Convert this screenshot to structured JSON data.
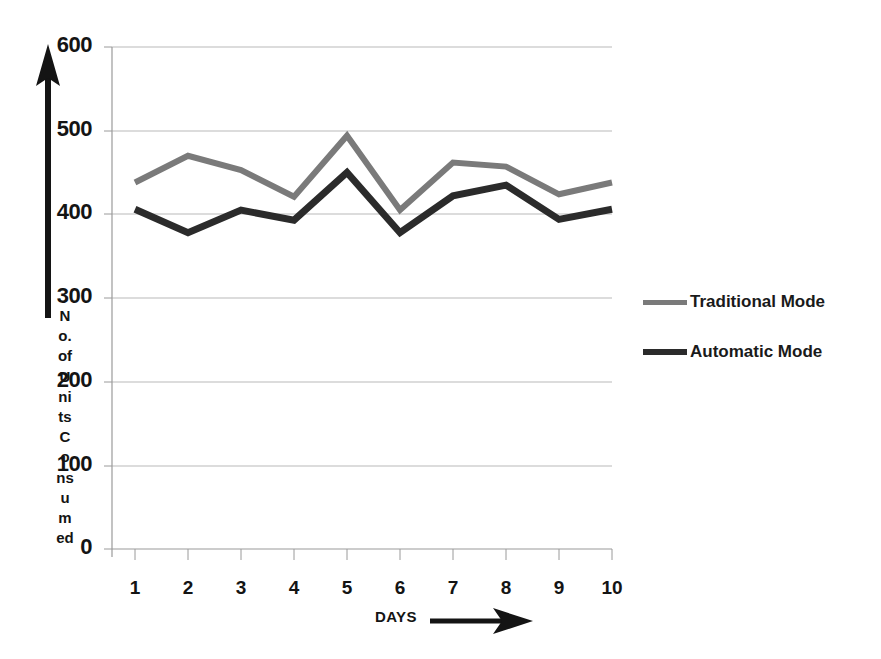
{
  "chart_data": {
    "type": "line",
    "title": "",
    "xlabel": "DAYS",
    "ylabel": "No. of Units Consumed",
    "categories": [
      "1",
      "2",
      "3",
      "4",
      "5",
      "6",
      "7",
      "8",
      "9",
      "10"
    ],
    "x": [
      1,
      2,
      3,
      4,
      5,
      6,
      7,
      8,
      9,
      10
    ],
    "series": [
      {
        "name": "Traditional Mode",
        "color": "#7a7a7a",
        "values": [
          438,
          470,
          453,
          421,
          494,
          405,
          462,
          457,
          424,
          438
        ]
      },
      {
        "name": "Automatic Mode",
        "color": "#2b2b2b",
        "values": [
          406,
          378,
          405,
          393,
          450,
          378,
          422,
          435,
          394,
          406
        ]
      }
    ],
    "ylim": [
      0,
      600
    ],
    "xlim": [
      0.5,
      10.5
    ],
    "ytick_labels": [
      "600",
      "500",
      "400",
      "300",
      "200",
      "100",
      "0"
    ],
    "ytick_values": [
      600,
      500,
      400,
      300,
      200,
      100,
      0
    ],
    "xtick_labels": [
      "1",
      "2",
      "3",
      "4",
      "5",
      "6",
      "7",
      "8",
      "9",
      "10"
    ],
    "grid": "horizontal",
    "legend_position": "right",
    "axis_arrows": {
      "y_axis_arrow": "up-arrow-icon",
      "x_axis_arrow": "right-arrow-icon"
    }
  },
  "axes": {
    "y_title_letters": [
      "N",
      "o.",
      "of",
      "U",
      "ni",
      "ts",
      "C",
      "o",
      "ns",
      "u",
      "m",
      "ed"
    ],
    "y_title_full": "No. of Units Consumed",
    "x_title": "DAYS"
  },
  "legend": {
    "items": [
      {
        "label": "Traditional Mode",
        "color": "#7a7a7a",
        "thickness": "5px"
      },
      {
        "label": "Automatic Mode",
        "color": "#2b2b2b",
        "thickness": "6px"
      }
    ]
  },
  "colors": {
    "traditional": "#7a7a7a",
    "automatic": "#2b2b2b",
    "grid": "#b9b9b9",
    "axis": "#9a9a9a",
    "text": "#141414",
    "background": "#ffffff"
  }
}
